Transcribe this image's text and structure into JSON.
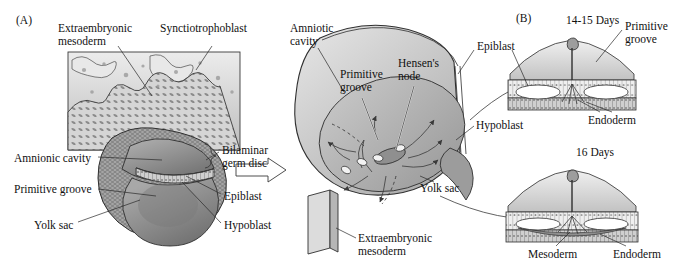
{
  "figure": {
    "panels": [
      {
        "id": "panel-a",
        "label": "(A)",
        "x": 16,
        "y": 14
      },
      {
        "id": "panel-b",
        "label": "(B)",
        "x": 516,
        "y": 12
      }
    ]
  },
  "panel_a": {
    "labels": [
      {
        "name": "extraembryonic-mesoderm",
        "text": "Extraembryonic\nmesoderm",
        "x": 58,
        "y": 22
      },
      {
        "name": "synctiotrophoblast",
        "text": "Synctiotrophoblast",
        "x": 160,
        "y": 22
      },
      {
        "name": "amnionic-cavity",
        "text": "Amnionic cavity",
        "x": 14,
        "y": 152
      },
      {
        "name": "primitive-groove",
        "text": "Primitive groove",
        "x": 14,
        "y": 183
      },
      {
        "name": "yolk-sac",
        "text": "Yolk sac",
        "x": 34,
        "y": 219
      },
      {
        "name": "bilaminar-germ-disc",
        "text": "Bilaminar\ngerm disc",
        "x": 222,
        "y": 144
      },
      {
        "name": "epiblast",
        "text": "Epiblast",
        "x": 224,
        "y": 190
      },
      {
        "name": "hypoblast",
        "text": "Hypoblast",
        "x": 224,
        "y": 219
      }
    ]
  },
  "panel_mid": {
    "labels": [
      {
        "name": "amniotic-cavity",
        "text": "Amniotic\ncavity",
        "x": 290,
        "y": 22
      },
      {
        "name": "primitive-groove",
        "text": "Primitive\ngroove",
        "x": 340,
        "y": 68
      },
      {
        "name": "hensens-node",
        "text": "Hensen's\nnode",
        "x": 398,
        "y": 57
      },
      {
        "name": "epiblast",
        "text": "Epiblast",
        "x": 477,
        "y": 40
      },
      {
        "name": "hypoblast",
        "text": "Hypoblast",
        "x": 476,
        "y": 119
      },
      {
        "name": "yolk-sac",
        "text": "Yolk sac",
        "x": 420,
        "y": 182
      },
      {
        "name": "extraembryonic-mesoderm",
        "text": "Extraembryonic\nmesoderm",
        "x": 358,
        "y": 232
      }
    ]
  },
  "panel_b": {
    "diagrams": [
      {
        "name": "stage-14-15-days",
        "title": "14-15 Days",
        "title_x": 566,
        "title_y": 14,
        "labels": [
          {
            "name": "primitive-groove",
            "text": "Primitive\ngroove",
            "x": 625,
            "y": 20
          },
          {
            "name": "epiblast",
            "text": "Epiblast",
            "x": 476,
            "y": 40
          },
          {
            "name": "endoderm",
            "text": "Endoderm",
            "x": 588,
            "y": 114
          }
        ]
      },
      {
        "name": "stage-16-days",
        "title": "16 Days",
        "title_x": 576,
        "title_y": 146,
        "labels": [
          {
            "name": "mesoderm",
            "text": "Mesoderm",
            "x": 528,
            "y": 248
          },
          {
            "name": "endoderm",
            "text": "Endoderm",
            "x": 613,
            "y": 248
          }
        ]
      }
    ]
  },
  "colors": {
    "ink": "#1a1a1a",
    "line": "#2a2a2a",
    "tissue_light": "#d9d9d9",
    "tissue_mid": "#b4b4b4",
    "tissue_dark": "#8d8d8d",
    "sac_dark": "#7e7e7e",
    "background": "#ffffff"
  }
}
